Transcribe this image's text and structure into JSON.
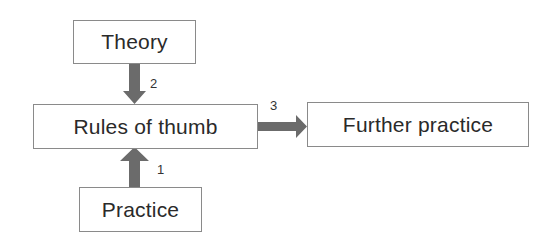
{
  "diagram": {
    "nodes": [
      {
        "id": "theory",
        "label": "Theory"
      },
      {
        "id": "rules",
        "label": "Rules of thumb"
      },
      {
        "id": "further",
        "label": "Further practice"
      },
      {
        "id": "practice",
        "label": "Practice"
      }
    ],
    "edges": [
      {
        "from": "practice",
        "to": "rules",
        "label": "1"
      },
      {
        "from": "theory",
        "to": "rules",
        "label": "2"
      },
      {
        "from": "rules",
        "to": "further",
        "label": "3"
      }
    ],
    "colors": {
      "arrow": "#6b6b6b",
      "border": "#8a8a8a",
      "text": "#2a2a2a"
    }
  }
}
